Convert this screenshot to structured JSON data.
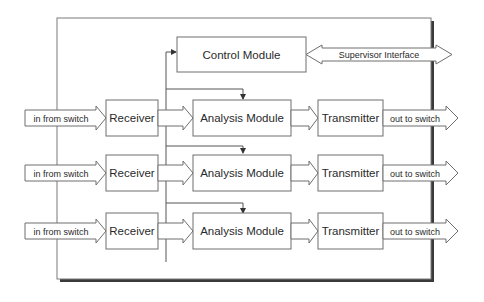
{
  "colors": {
    "line": "#6e6e6e",
    "shadow": "#3a3a3a",
    "text": "#2a2a2a",
    "background": "#ffffff"
  },
  "control": {
    "module_label": "Control Module",
    "supervisor_label": "Supervisor Interface"
  },
  "rows": [
    {
      "input_label": "in from switch",
      "receiver_label": "Receiver",
      "analysis_label": "Analysis Module",
      "transmitter_label": "Transmitter",
      "output_label": "out to switch"
    },
    {
      "input_label": "in from switch",
      "receiver_label": "Receiver",
      "analysis_label": "Analysis Module",
      "transmitter_label": "Transmitter",
      "output_label": "out to switch"
    },
    {
      "input_label": "in from switch",
      "receiver_label": "Receiver",
      "analysis_label": "Analysis Module",
      "transmitter_label": "Transmitter",
      "output_label": "out to switch"
    }
  ]
}
